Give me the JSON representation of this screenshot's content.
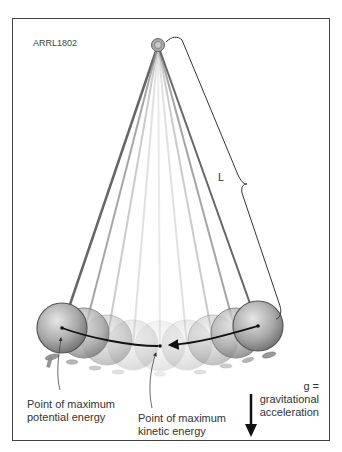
{
  "figure": {
    "id_label": "ARRL1802",
    "length_label": "L",
    "labels": {
      "max_potential": [
        "Point of maximum",
        "potential energy"
      ],
      "max_kinetic": [
        "Point of maximum",
        "kinetic energy"
      ],
      "gravity": [
        "g = gravitational",
        "acceleration"
      ]
    },
    "pivot": {
      "x": 158,
      "y": 45
    },
    "balls": [
      {
        "x": 62,
        "y": 328,
        "opacity": 1.0
      },
      {
        "x": 84,
        "y": 333,
        "opacity": 0.75
      },
      {
        "x": 107,
        "y": 340,
        "opacity": 0.5
      },
      {
        "x": 133,
        "y": 345,
        "opacity": 0.3
      },
      {
        "x": 160,
        "y": 346,
        "opacity": 0.2
      },
      {
        "x": 187,
        "y": 345,
        "opacity": 0.3
      },
      {
        "x": 213,
        "y": 340,
        "opacity": 0.5
      },
      {
        "x": 236,
        "y": 333,
        "opacity": 0.75
      },
      {
        "x": 258,
        "y": 326,
        "opacity": 1.0
      }
    ],
    "colors": {
      "frame": "#444444",
      "ball": "#8f8f8f",
      "text": "#333333"
    }
  }
}
